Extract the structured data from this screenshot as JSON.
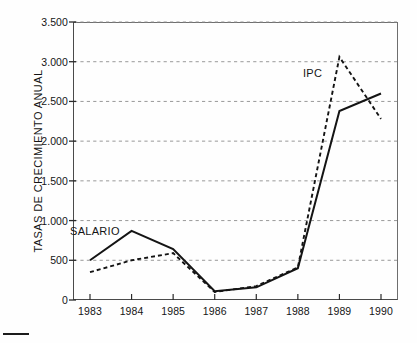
{
  "figure": {
    "background": "#fefefe",
    "ink_color": "#141414",
    "grid_color": "#8d8d8d"
  },
  "axes": {
    "y_title": "TASAS DE CRECIMIENTO ANUAL",
    "y_ticks": [
      "0",
      "500",
      "1.000",
      "1.500",
      "2.000",
      "2.500",
      "3.000",
      "3.500"
    ],
    "x_ticks": [
      "1983",
      "1984",
      "1985",
      "1986",
      "1987",
      "1988",
      "1989",
      "1990"
    ]
  },
  "annotations": {
    "salario": "SALARIO",
    "ipc": "IPC"
  },
  "chart_data": {
    "type": "line",
    "title": "",
    "xlabel": "",
    "ylabel": "TASAS DE CRECIMIENTO ANUAL",
    "x": [
      1983,
      1984,
      1985,
      1986,
      1987,
      1988,
      1989,
      1990
    ],
    "categories": [
      "1983",
      "1984",
      "1985",
      "1986",
      "1987",
      "1988",
      "1989",
      "1990"
    ],
    "xlim": [
      1983,
      1990
    ],
    "ylim": [
      0,
      3500
    ],
    "ytick_values": [
      0,
      500,
      1000,
      1500,
      2000,
      2500,
      3000,
      3500
    ],
    "grid": "horizontal-dashed",
    "legend": "inline-annotations",
    "series": [
      {
        "name": "SALARIO",
        "style": "solid",
        "color": "#141414",
        "values": [
          500,
          870,
          640,
          110,
          160,
          400,
          2380,
          2600
        ]
      },
      {
        "name": "IPC",
        "style": "dashed",
        "color": "#141414",
        "values": [
          350,
          500,
          590,
          100,
          175,
          410,
          3060,
          2280
        ]
      }
    ],
    "notes": [
      "IPC peaks at approximately 3.060 in 1989 then falls to about 2.280 in 1990",
      "SALARIO peaks at about 870 in 1984, bottoms near 110 in 1986, and rises to about 2.600 in 1990"
    ]
  }
}
